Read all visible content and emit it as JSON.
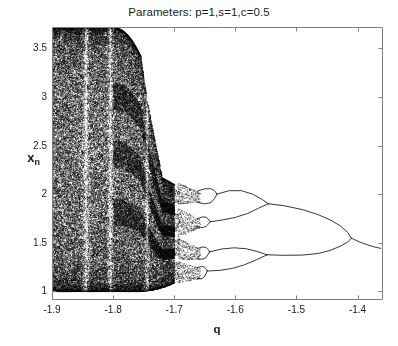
{
  "figure": {
    "background_color": "#ffffff",
    "axes_color": "#808080",
    "point_color": "#000000"
  },
  "chart_data": {
    "type": "scatter",
    "title": "Parameters: p=1,s=1,c=0.5",
    "xlabel": "q",
    "ylabel_base": "x",
    "ylabel_sub": "n",
    "xlim": [
      -1.9,
      -1.36
    ],
    "ylim": [
      0.92,
      3.72
    ],
    "xticks": [
      -1.9,
      -1.8,
      -1.7,
      -1.6,
      -1.5,
      -1.4
    ],
    "xtick_labels": [
      "-1.9",
      "-1.8",
      "-1.7",
      "-1.6",
      "-1.5",
      "-1.4"
    ],
    "yticks": [
      1,
      1.5,
      2,
      2.5,
      3,
      3.5
    ],
    "ytick_labels": [
      "1",
      "1.5",
      "2",
      "2.5",
      "3",
      "3.5"
    ],
    "grid": false,
    "legend": null,
    "features": {
      "chaos_region_q": [
        -1.9,
        -1.72
      ],
      "chaos_upper_envelope_start": 3.72,
      "chaos_lower_envelope": 1.0,
      "periodic_windows_q": [
        -1.845,
        -1.805,
        -1.745
      ],
      "period4_merge_q": -1.655,
      "period2_upper_merge_q": -1.63,
      "period2_lower_merge_q": -1.655,
      "final_merge_q": -1.41,
      "final_value_at_right_edge": 1.42,
      "upper_branch_value_at_merge": 1.77,
      "lower_branch_value_at_merge": 1.3
    },
    "series": [
      {
        "name": "attractor-points",
        "kind": "chaotic-scatter"
      },
      {
        "name": "period-branches",
        "kind": "curves"
      }
    ]
  },
  "axes_geometry": {
    "left_px": 52,
    "right_px": 382,
    "top_px": 27,
    "bottom_px": 299
  }
}
